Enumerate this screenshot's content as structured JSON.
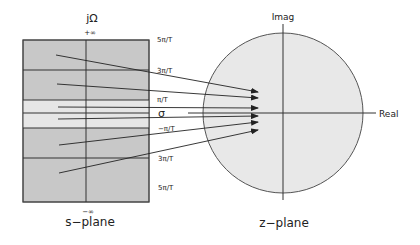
{
  "s_plane": {
    "title": "s−plane",
    "axis_label_vertical": "jΩ",
    "plus_infinity": "+∞",
    "minus_infinity": "−∞",
    "sigma_label": "σ",
    "strip_labels": [
      "5π/T",
      "3π/T",
      "π/T",
      "−π/T",
      "3π/T",
      "5π/T"
    ],
    "colors": {
      "outer_strip": "#c8c8c8",
      "primary_strip": "#e6e6e6",
      "lines": "#333333"
    }
  },
  "z_plane": {
    "title": "z−plane",
    "imag_label": "Imag",
    "real_label": "Real",
    "colors": {
      "circle_fill": "#e8e8e8",
      "circle_stroke": "#555555"
    }
  }
}
